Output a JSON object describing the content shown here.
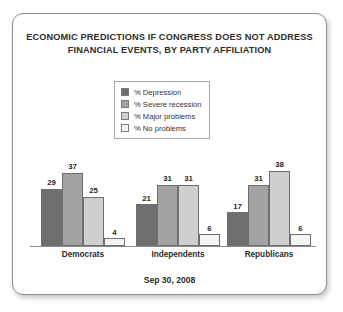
{
  "card": {
    "title_lines": [
      "ECONOMIC PREDICTIONS IF CONGRESS DOES NOT ADDRESS",
      "FINANCIAL EVENTS, BY PARTY AFFILIATION"
    ],
    "footer": "Sep 30, 2008"
  },
  "chart_data": {
    "type": "bar",
    "title": "ECONOMIC PREDICTIONS IF CONGRESS DOES NOT ADDRESS FINANCIAL EVENTS, BY PARTY AFFILIATION",
    "subtitle": "Sep 30, 2008",
    "xlabel": "",
    "ylabel": "",
    "ylim": [
      0,
      45
    ],
    "grid": false,
    "legend_position": "top-center",
    "categories": [
      "Democrats",
      "Independents",
      "Republicans"
    ],
    "series": [
      {
        "name": "% Depression",
        "color": "#6e6e6e",
        "values": [
          29,
          21,
          17
        ]
      },
      {
        "name": "% Severe recession",
        "color": "#a3a3a3",
        "values": [
          37,
          31,
          31
        ]
      },
      {
        "name": "% Major problems",
        "color": "#cfcfcf",
        "values": [
          25,
          31,
          38
        ]
      },
      {
        "name": "% No problems",
        "color": "#f4f4f4",
        "values": [
          4,
          6,
          6
        ]
      }
    ]
  }
}
